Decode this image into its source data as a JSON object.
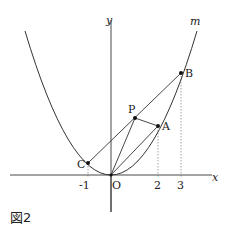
{
  "figure": {
    "caption": "図2",
    "curve_label": "m",
    "axes": {
      "x_label": "x",
      "y_label": "y",
      "origin_label": "O"
    },
    "ticks": [
      {
        "value": -1,
        "label": "-1"
      },
      {
        "value": 2,
        "label": "2"
      },
      {
        "value": 3,
        "label": "3"
      }
    ],
    "points": [
      {
        "name": "A",
        "label": "A",
        "x": 2
      },
      {
        "name": "B",
        "label": "B",
        "x": 3
      },
      {
        "name": "C",
        "label": "C",
        "x": -1
      },
      {
        "name": "P",
        "label": "P"
      }
    ],
    "segments": [
      "C-B",
      "P-A",
      "P-O",
      "O-A",
      "O-B"
    ]
  }
}
